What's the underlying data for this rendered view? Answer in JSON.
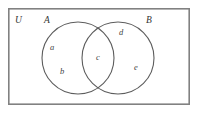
{
  "diagram": {
    "type": "venn-diagram",
    "universe": {
      "label": "U",
      "x": 16,
      "y": 16
    },
    "sets": [
      {
        "id": "A",
        "label": "A",
        "label_x": 44,
        "label_y": 16,
        "cx": 78,
        "cy": 58,
        "r": 36
      },
      {
        "id": "B",
        "label": "B",
        "label_x": 146,
        "label_y": 16,
        "cx": 118,
        "cy": 58,
        "r": 36
      }
    ],
    "regions": [
      {
        "id": "a",
        "label": "a",
        "belongs_to": "A-only",
        "x": 50,
        "y": 43
      },
      {
        "id": "b",
        "label": "b",
        "belongs_to": "A-only",
        "x": 60,
        "y": 67
      },
      {
        "id": "c",
        "label": "c",
        "belongs_to": "A-intersect-B",
        "x": 96,
        "y": 53
      },
      {
        "id": "d",
        "label": "d",
        "belongs_to": "B-only",
        "x": 119,
        "y": 28
      },
      {
        "id": "e",
        "label": "e",
        "belongs_to": "B-only",
        "x": 134,
        "y": 63
      }
    ],
    "frame": {
      "x": 8,
      "y": 8,
      "width": 182,
      "height": 97
    },
    "colors": {
      "background": "#ffffff",
      "frame_stroke": "#818181",
      "circle_stroke": "#5d5d5d",
      "text": "#3a3a3a"
    }
  }
}
